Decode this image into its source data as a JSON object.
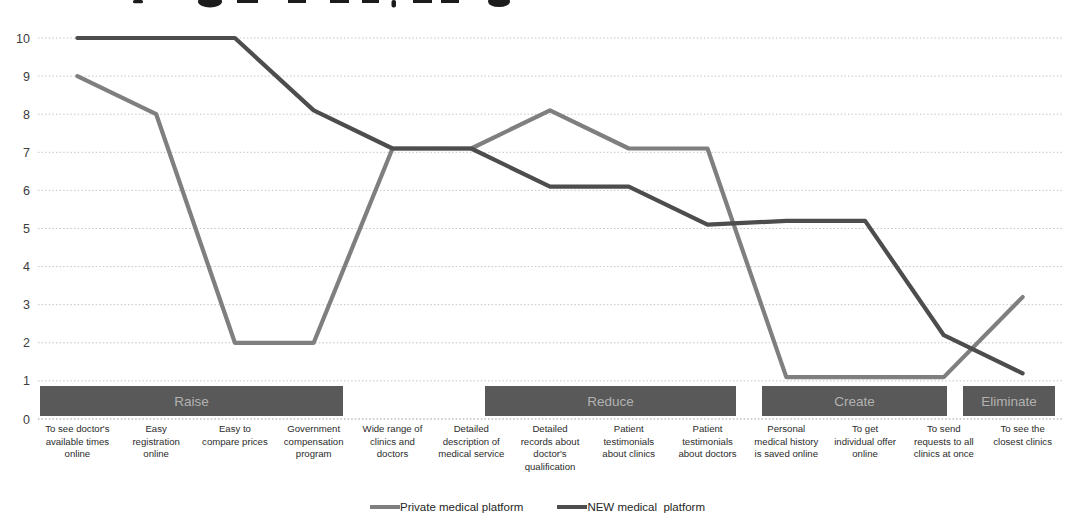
{
  "chart_data": {
    "type": "line",
    "categories": [
      "To see doctor's\navailable times\nonline",
      "Easy\nregistration\nonline",
      "Easy to\ncompare prices",
      "Government\ncompensation\nprogram",
      "Wide range of\nclinics and\ndoctors",
      "Detailed\ndescription of\nmedical service",
      "Detailed\nrecords about\ndoctor's\nqualification",
      "Patient\ntestimonials\nabout clinics",
      "Patient\ntestimonials\nabout doctors",
      "Personal\nmedical history\nis saved online",
      "To get\nindividual offer\nonline",
      "To send\nrequests to all\nclinics at once",
      "To see the\nclosest clinics"
    ],
    "series": [
      {
        "name": "Private medical platform",
        "color": "#7f7f7f",
        "values": [
          9,
          8,
          2,
          2,
          7.1,
          7.1,
          8.1,
          7.1,
          7.1,
          1.1,
          1.1,
          1.1,
          3.2
        ]
      },
      {
        "name": "NEW medical  platform",
        "color": "#4d4d4d",
        "values": [
          10,
          10,
          10,
          8.1,
          7.1,
          7.1,
          6.1,
          6.1,
          5.1,
          5.2,
          5.2,
          2.2,
          1.2
        ]
      }
    ],
    "ylim": [
      0,
      10
    ],
    "yticks": [
      0,
      1,
      2,
      3,
      4,
      5,
      6,
      7,
      8,
      9,
      10
    ],
    "grid": true,
    "legend_position": "bottom"
  },
  "bands": [
    {
      "label": "Raise",
      "x_start": 40,
      "x_end": 343
    },
    {
      "label": "Reduce",
      "x_start": 485,
      "x_end": 736
    },
    {
      "label": "Create",
      "x_start": 762,
      "x_end": 947
    },
    {
      "label": "Eliminate",
      "x_start": 963,
      "x_end": 1055
    }
  ],
  "colors": {
    "band_fill": "#595959",
    "band_text": "#b2b2b2",
    "gridline": "#c4c4c4",
    "axis_line": "#9e9e9e",
    "title_fragment": "#1c1c1c"
  }
}
